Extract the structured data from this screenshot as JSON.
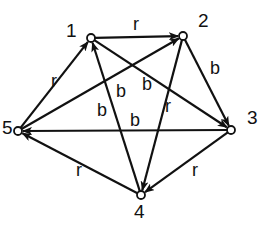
{
  "diagram": {
    "type": "directed-graph",
    "colors": {
      "stroke": "#111111",
      "background": "#ffffff",
      "node_fill": "#ffffff"
    },
    "nodes": [
      {
        "id": "1",
        "label": "1",
        "x": 91,
        "y": 38,
        "lx": 66,
        "ly": 37
      },
      {
        "id": "2",
        "label": "2",
        "x": 183,
        "y": 36,
        "lx": 198,
        "ly": 27
      },
      {
        "id": "3",
        "label": "3",
        "x": 231,
        "y": 130,
        "lx": 247,
        "ly": 124
      },
      {
        "id": "4",
        "label": "4",
        "x": 141,
        "y": 195,
        "lx": 134,
        "ly": 218
      },
      {
        "id": "5",
        "label": "5",
        "x": 18,
        "y": 131,
        "lx": 2,
        "ly": 134
      }
    ],
    "edges": [
      {
        "from": "1",
        "to": "2",
        "label": "r",
        "lx": 133,
        "ly": 30
      },
      {
        "from": "2",
        "to": "3",
        "label": "b",
        "lx": 210,
        "ly": 74
      },
      {
        "from": "3",
        "to": "4",
        "label": "r",
        "lx": 192,
        "ly": 176
      },
      {
        "from": "4",
        "to": "5",
        "label": "r",
        "lx": 76,
        "ly": 176
      },
      {
        "from": "5",
        "to": "1",
        "label": "r",
        "lx": 51,
        "ly": 87
      },
      {
        "from": "1",
        "to": "3",
        "label": "b",
        "lx": 142,
        "ly": 90
      },
      {
        "from": "5",
        "to": "2",
        "label": "b",
        "lx": 116,
        "ly": 97
      },
      {
        "from": "4",
        "to": "1",
        "label": "b",
        "lx": 97,
        "ly": 116
      },
      {
        "from": "2",
        "to": "4",
        "label": "r",
        "lx": 165,
        "ly": 112
      },
      {
        "from": "3",
        "to": "5",
        "label": "b",
        "lx": 130,
        "ly": 126
      }
    ]
  }
}
